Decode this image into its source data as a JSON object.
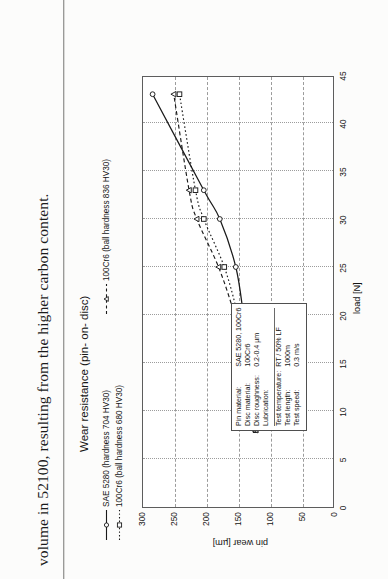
{
  "document": {
    "body_text": "volume in 52100, resulting from the higher carbon content.",
    "clipped_line_above": " "
  },
  "figure": {
    "title": "Wear resistance (pin- on- disc)",
    "legend": [
      {
        "label": "SAE 5280 (hardness 704 HV30)",
        "style": "solid-line-open-circle",
        "marker": "circle",
        "color": "#1a1a1a"
      },
      {
        "label": "100Cr6 (ball hardness 836 HV30)",
        "style": "dashed-line-open-triangle",
        "marker": "triangle",
        "color": "#1a1a1a"
      },
      {
        "label": "100Cr6 (ball hardness 680 HV30)",
        "style": "dotted-line-open-square",
        "marker": "square",
        "color": "#1a1a1a"
      }
    ],
    "parameters": {
      "title": "test conditions",
      "rows": [
        {
          "name": "Pin material:",
          "value": "SAE 5280, 100Cr6"
        },
        {
          "name": "Disc material:",
          "value": "100Cr6"
        },
        {
          "name": "Disc roughness:",
          "value": "0.2-0.4 µm"
        },
        {
          "name": "Lubrication:",
          "value": ""
        },
        {
          "name": "Test temperature:",
          "value": "RT / 50% LF"
        },
        {
          "name": "Test length:",
          "value": "1000m"
        },
        {
          "name": "Test speed:",
          "value": "0.3 m/s"
        }
      ]
    }
  },
  "chart_data": {
    "type": "line",
    "title": "Wear resistance (pin- on- disc)",
    "xlabel": "load [N]",
    "ylabel": "pin wear [µm]",
    "xlim": [
      0,
      45
    ],
    "ylim": [
      0,
      300
    ],
    "xticks": [
      0,
      5,
      10,
      15,
      20,
      25,
      30,
      35,
      40,
      45
    ],
    "yticks": [
      0,
      50,
      100,
      150,
      200,
      250,
      300
    ],
    "grid": true,
    "legend_position": "above-plot",
    "series": [
      {
        "name": "SAE 5280 (hardness 704 HV30)",
        "marker": "circle",
        "line": "solid",
        "x": [
          8,
          10,
          15,
          20,
          25,
          30,
          33,
          43
        ],
        "y": [
          125,
          123,
          133,
          143,
          155,
          180,
          205,
          285
        ]
      },
      {
        "name": "100Cr6 (ball hardness 680 HV30)",
        "marker": "square",
        "line": "dotted",
        "x": [
          8,
          10,
          15,
          20,
          25,
          30,
          33,
          43
        ],
        "y": [
          124,
          126,
          137,
          152,
          173,
          205,
          218,
          243
        ]
      },
      {
        "name": "100Cr6 (ball hardness 836 HV30)",
        "marker": "triangle",
        "line": "dashed",
        "x": [
          8,
          10,
          15,
          20,
          25,
          30,
          33,
          43
        ],
        "y": [
          124,
          127,
          140,
          157,
          182,
          216,
          228,
          252
        ]
      }
    ]
  }
}
